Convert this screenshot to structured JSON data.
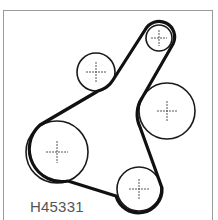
{
  "figure": {
    "label": "H45331",
    "colors": {
      "belt": "#111111",
      "pulley_outline": "#1a1a1a",
      "center_mark": "#444444",
      "frame": "#9a9a9a",
      "label": "#555555"
    }
  },
  "pulleys": [
    {
      "name": "top-pulley",
      "cx": 159,
      "cy": 38,
      "r": 13
    },
    {
      "name": "idler-pulley",
      "cx": 96,
      "cy": 72,
      "r": 19
    },
    {
      "name": "right-pulley",
      "cx": 167,
      "cy": 111,
      "r": 28
    },
    {
      "name": "crankshaft-pulley",
      "cx": 57,
      "cy": 152,
      "r": 31
    },
    {
      "name": "bottom-pulley",
      "cx": 139,
      "cy": 189,
      "r": 22
    }
  ]
}
